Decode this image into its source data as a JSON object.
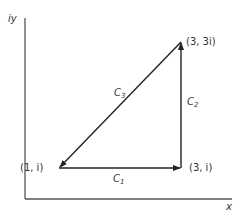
{
  "axes": {
    "y_label": "iy",
    "x_label": "x"
  },
  "points": [
    {
      "id": "p1",
      "label": "(1, i)",
      "px": 59,
      "py": 168
    },
    {
      "id": "p2",
      "label": "(3, i)",
      "px": 181,
      "py": 168
    },
    {
      "id": "p3",
      "label": "(3, 3i)",
      "px": 181,
      "py": 42
    }
  ],
  "segments": [
    {
      "id": "C1",
      "label": "C",
      "sub": "1",
      "from": "p1",
      "to": "p2"
    },
    {
      "id": "C2",
      "label": "C",
      "sub": "2",
      "from": "p2",
      "to": "p3"
    },
    {
      "id": "C3",
      "label": "C",
      "sub": "3",
      "from": "p3",
      "to": "p1"
    }
  ],
  "colors": {
    "line": "#222222",
    "axis": "#555555",
    "text": "#333333"
  }
}
